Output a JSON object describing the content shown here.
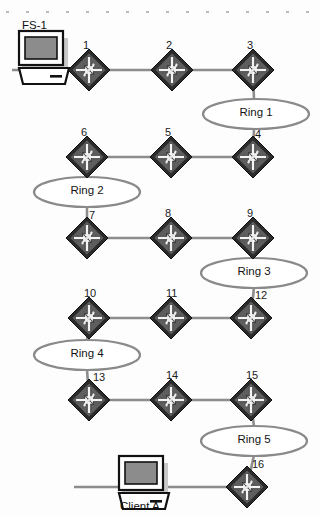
{
  "figure": {
    "type": "network-topology-diagram",
    "title": "",
    "background": "#fdfdfd",
    "width": 320,
    "height": 515
  },
  "palette": {
    "router_body": "#2b2b2b",
    "router_inner": "#5a5a5a",
    "router_arrow": "#f2f2f2",
    "link": "#8d8d8d",
    "ring_stroke": "#8a8a8a",
    "text": "#111111",
    "screen": "#8c8c8c",
    "host_outline": "#111111",
    "host_fill": "#ffffff",
    "shadow": "#c9c9c9",
    "speckle": "#b9b9b9"
  },
  "hosts": [
    {
      "id": "fs-1",
      "label": "FS-1",
      "icon": "workstation-icon",
      "x": 18,
      "y": 30,
      "label_x": 22,
      "label_y": 19
    },
    {
      "id": "client-a",
      "label": "Client A",
      "icon": "workstation-icon",
      "x": 118,
      "y": 455,
      "label_x": 120,
      "label_y": 500
    }
  ],
  "routers": [
    {
      "label": "1",
      "x": 89,
      "y": 70,
      "label_dx": -2,
      "label_dy": -24
    },
    {
      "label": "2",
      "x": 172,
      "y": 70,
      "label_dx": -2,
      "label_dy": -24
    },
    {
      "label": "3",
      "x": 253,
      "y": 70,
      "label_dx": -2,
      "label_dy": -24
    },
    {
      "label": "4",
      "x": 253,
      "y": 157,
      "label_dx": 6,
      "label_dy": -22
    },
    {
      "label": "5",
      "x": 171,
      "y": 157,
      "label_dx": -2,
      "label_dy": -24
    },
    {
      "label": "6",
      "x": 87,
      "y": 157,
      "label_dx": -2,
      "label_dy": -24
    },
    {
      "label": "7",
      "x": 87,
      "y": 238,
      "label_dx": 6,
      "label_dy": -22
    },
    {
      "label": "8",
      "x": 171,
      "y": 238,
      "label_dx": -2,
      "label_dy": -24
    },
    {
      "label": "9",
      "x": 253,
      "y": 238,
      "label_dx": -2,
      "label_dy": -24
    },
    {
      "label": "10",
      "x": 89,
      "y": 318,
      "label_dx": -1,
      "label_dy": -24
    },
    {
      "label": "11",
      "x": 171,
      "y": 318,
      "label_dx": -1,
      "label_dy": -24
    },
    {
      "label": "12",
      "x": 251,
      "y": 318,
      "label_dx": 8,
      "label_dy": -22
    },
    {
      "label": "13",
      "x": 89,
      "y": 400,
      "label_dx": 8,
      "label_dy": -22
    },
    {
      "label": "14",
      "x": 171,
      "y": 400,
      "label_dx": -1,
      "label_dy": -24
    },
    {
      "label": "15",
      "x": 251,
      "y": 400,
      "label_dx": -1,
      "label_dy": -24
    },
    {
      "label": "16",
      "x": 247,
      "y": 487,
      "label_dx": 9,
      "label_dy": -22
    }
  ],
  "rings": [
    {
      "label": "Ring 1",
      "cx": 256,
      "cy": 114,
      "rx": 53,
      "ry": 15
    },
    {
      "label": "Ring 2",
      "cx": 87,
      "cy": 192,
      "rx": 53,
      "ry": 15
    },
    {
      "label": "Ring 3",
      "cx": 254,
      "cy": 273,
      "rx": 53,
      "ry": 15
    },
    {
      "label": "Ring 4",
      "cx": 87,
      "cy": 355,
      "rx": 53,
      "ry": 15
    },
    {
      "label": "Ring 5",
      "cx": 254,
      "cy": 441,
      "rx": 53,
      "ry": 15
    }
  ],
  "links": [
    {
      "from": "fs-1",
      "to": "1",
      "kind": "segment-horizontal"
    },
    {
      "from": "1",
      "to": "2",
      "kind": "segment-horizontal"
    },
    {
      "from": "2",
      "to": "3",
      "kind": "segment-horizontal"
    },
    {
      "from": "3",
      "to": "Ring 1",
      "kind": "drop-vertical"
    },
    {
      "from": "Ring 1",
      "to": "4",
      "kind": "drop-vertical"
    },
    {
      "from": "4",
      "to": "5",
      "kind": "segment-horizontal"
    },
    {
      "from": "5",
      "to": "6",
      "kind": "segment-horizontal"
    },
    {
      "from": "6",
      "to": "Ring 2",
      "kind": "drop-vertical"
    },
    {
      "from": "Ring 2",
      "to": "7",
      "kind": "drop-vertical"
    },
    {
      "from": "7",
      "to": "8",
      "kind": "segment-horizontal"
    },
    {
      "from": "8",
      "to": "9",
      "kind": "segment-horizontal"
    },
    {
      "from": "9",
      "to": "Ring 3",
      "kind": "drop-vertical"
    },
    {
      "from": "Ring 3",
      "to": "12",
      "kind": "drop-vertical"
    },
    {
      "from": "12",
      "to": "11",
      "kind": "segment-horizontal"
    },
    {
      "from": "11",
      "to": "10",
      "kind": "segment-horizontal"
    },
    {
      "from": "10",
      "to": "Ring 4",
      "kind": "drop-vertical"
    },
    {
      "from": "Ring 4",
      "to": "13",
      "kind": "drop-vertical"
    },
    {
      "from": "13",
      "to": "14",
      "kind": "segment-horizontal"
    },
    {
      "from": "14",
      "to": "15",
      "kind": "segment-horizontal"
    },
    {
      "from": "15",
      "to": "Ring 5",
      "kind": "drop-vertical"
    },
    {
      "from": "Ring 5",
      "to": "16",
      "kind": "drop-vertical"
    },
    {
      "from": "client-a",
      "to": "16",
      "kind": "segment-horizontal"
    }
  ],
  "speckles": {
    "count": 16,
    "y": 11,
    "start_x": 6,
    "step_x": 20,
    "color": "#b9b9b9"
  }
}
